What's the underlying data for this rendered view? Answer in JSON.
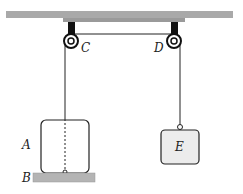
{
  "diagram": {
    "labels": {
      "pulley_left": "C",
      "pulley_right": "D",
      "block_left": "A",
      "floor": "B",
      "block_right": "E"
    },
    "colors": {
      "ceiling": "#a9a9a9",
      "floor": "#b4b4b4",
      "block_fill": "#f0f0f0",
      "block_right_fill": "#ececec",
      "line": "#222222"
    }
  }
}
